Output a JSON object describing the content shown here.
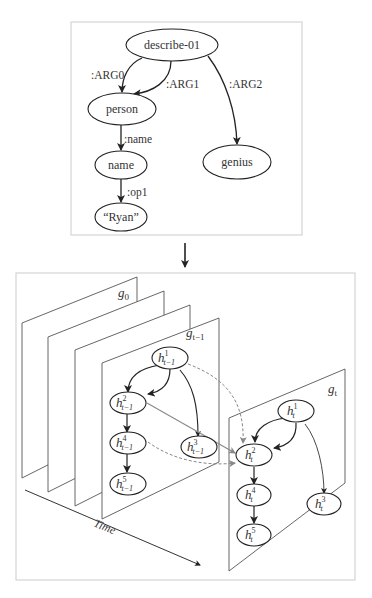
{
  "amr_graph": {
    "nodes": [
      {
        "id": "describe",
        "label": "describe-01"
      },
      {
        "id": "person",
        "label": "person"
      },
      {
        "id": "name",
        "label": "name"
      },
      {
        "id": "ryan",
        "label": "“Ryan”"
      },
      {
        "id": "genius",
        "label": "genius"
      }
    ],
    "edges": [
      {
        "from": "describe",
        "to": "person",
        "label": ":ARG0"
      },
      {
        "from": "describe",
        "to": "person",
        "label": ":ARG1"
      },
      {
        "from": "describe",
        "to": "genius",
        "label": ":ARG2"
      },
      {
        "from": "person",
        "to": "name",
        "label": ":name"
      },
      {
        "from": "name",
        "to": "ryan",
        "label": ":op1"
      }
    ]
  },
  "dynamic_graph": {
    "planes": [
      {
        "id": "g0",
        "base": "g",
        "sub": "0"
      },
      {
        "id": "gt-1",
        "base": "g",
        "sub": "t−1"
      },
      {
        "id": "gt",
        "base": "g",
        "sub": "t"
      }
    ],
    "prev_nodes": [
      {
        "id": "h1",
        "base": "h",
        "sup": "1",
        "sub": "t−1"
      },
      {
        "id": "h2",
        "base": "h",
        "sup": "2",
        "sub": "t−1"
      },
      {
        "id": "h3",
        "base": "h",
        "sup": "3",
        "sub": "t−1"
      },
      {
        "id": "h4",
        "base": "h",
        "sup": "4",
        "sub": "t−1"
      },
      {
        "id": "h5",
        "base": "h",
        "sup": "5",
        "sub": "t−1"
      }
    ],
    "curr_nodes": [
      {
        "id": "h1",
        "base": "h",
        "sup": "1",
        "sub": "t"
      },
      {
        "id": "h2",
        "base": "h",
        "sup": "2",
        "sub": "t"
      },
      {
        "id": "h3",
        "base": "h",
        "sup": "3",
        "sub": "t"
      },
      {
        "id": "h4",
        "base": "h",
        "sup": "4",
        "sub": "t"
      },
      {
        "id": "h5",
        "base": "h",
        "sup": "5",
        "sub": "t"
      }
    ],
    "time_axis_label": "Time"
  },
  "colors": {
    "line": "#222222",
    "frame": "#cfcfcf",
    "plane": "#555555",
    "temporal_edge": "#888888"
  }
}
